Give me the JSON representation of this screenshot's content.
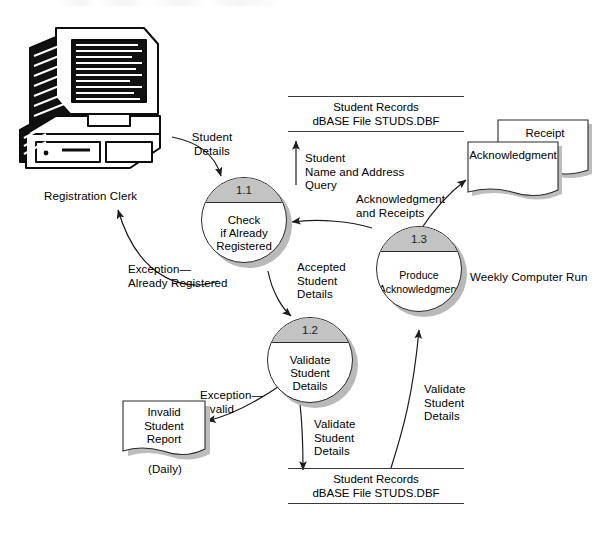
{
  "diagram": {
    "type": "data-flow-diagram"
  },
  "entities": {
    "registration_clerk": {
      "label": "Registration Clerk",
      "icon": "desktop-computer-icon"
    }
  },
  "processes": [
    {
      "id": "1.1",
      "name": "Check\nif Already\nRegistered"
    },
    {
      "id": "1.2",
      "name": "Validate\nStudent\nDetails"
    },
    {
      "id": "1.3",
      "name": "Produce\nAcknowledgment"
    }
  ],
  "datastores": [
    {
      "id": "store-top",
      "label": "Student Records\ndBASE File STUDS.DBF"
    },
    {
      "id": "store-bottom",
      "label": "Student Records\ndBASE File STUDS.DBF"
    }
  ],
  "documents": [
    {
      "id": "receipt",
      "label": "Receipt"
    },
    {
      "id": "acknowledgment",
      "label": "Acknowledgment"
    },
    {
      "id": "invalid-student-report",
      "label": "Invalid\nStudent\nReport",
      "caption": "(Daily)"
    }
  ],
  "flows": [
    {
      "id": "student-details",
      "label": "Student\nDetails"
    },
    {
      "id": "exception-already-registered",
      "label": "Exception—\nAlready Registered"
    },
    {
      "id": "student-name-address-query",
      "label": "Student\nName and Address\nQuery"
    },
    {
      "id": "accepted-student-details",
      "label": "Accepted\nStudent\nDetails"
    },
    {
      "id": "acknowledgment-and-receipts",
      "label": "Acknowledgment\nand Receipts"
    },
    {
      "id": "exception-invalid",
      "label": "Exception—\nInvalid"
    },
    {
      "id": "validate-student-details-down",
      "label": "Validate\nStudent\nDetails"
    },
    {
      "id": "validate-student-details-up",
      "label": "Validate\nStudent\nDetails"
    }
  ],
  "annotations": [
    {
      "id": "weekly-computer-run",
      "label": "Weekly Computer Run"
    }
  ],
  "colors": {
    "line": "#2b2b2b",
    "process_cap": "#c3c3c3",
    "shadow": "#b9b9b9",
    "background": "#ffffff"
  }
}
